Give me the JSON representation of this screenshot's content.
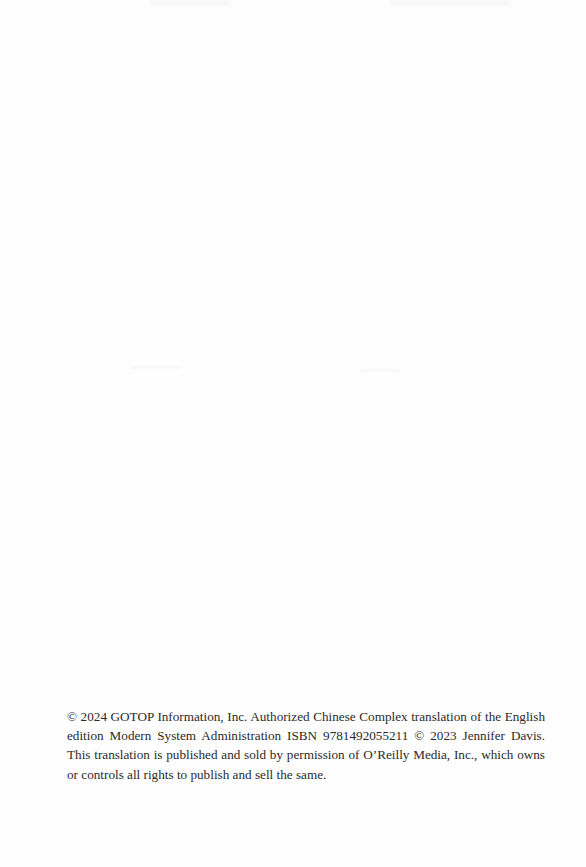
{
  "page": {
    "background": "#fefefe",
    "text_color": "#2a2a2a"
  },
  "copyright_notice": {
    "text": "© 2024 GOTOP Information, Inc. Authorized Chinese Complex translation of the English edition Modern System Administration ISBN 9781492055211 © 2023 Jennifer Davis. This translation is published and sold by permission of O’Reilly Media, Inc., which owns or controls all rights to publish and sell the same."
  }
}
